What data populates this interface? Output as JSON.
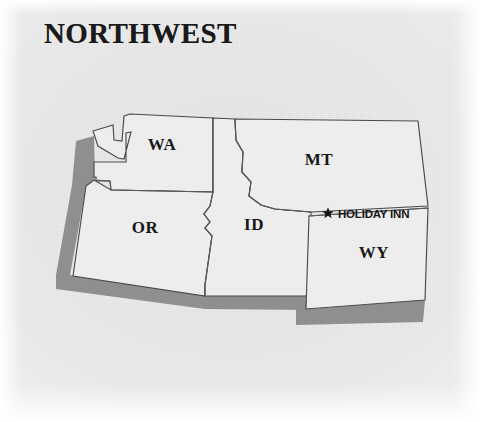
{
  "title": "NORTHWEST",
  "colors": {
    "background": "#f2f2f2",
    "state_fill": "#ededed",
    "border": "#4a4a4a",
    "shadow": "#8f8f8f",
    "text": "#171717"
  },
  "map": {
    "type": "regional-state-map",
    "region": "Northwest",
    "states": [
      {
        "code": "WA",
        "name_label": "WA",
        "label_x": 162,
        "label_y": 150
      },
      {
        "code": "OR",
        "name_label": "OR",
        "label_x": 145,
        "label_y": 233
      },
      {
        "code": "ID",
        "name_label": "ID",
        "label_x": 254,
        "label_y": 230
      },
      {
        "code": "MT",
        "name_label": "MT",
        "label_x": 319,
        "label_y": 165
      },
      {
        "code": "WY",
        "name_label": "WY",
        "label_x": 374,
        "label_y": 258
      }
    ],
    "points_of_interest": [
      {
        "label": "HOLIDAY INN",
        "marker": "star-marker",
        "marker_x": 328,
        "marker_y": 213,
        "label_x": 338,
        "label_y": 217
      }
    ],
    "legend": null
  }
}
